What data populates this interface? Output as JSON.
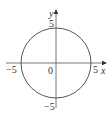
{
  "diagram": {
    "type": "circle-on-axes",
    "equation": "x^2 + y^2 = 25",
    "center": [
      0,
      0
    ],
    "radius": 5,
    "x_axis_label": "x",
    "y_axis_label": "y",
    "origin_label": "0",
    "x_ticks": {
      "neg": "−5",
      "pos": "5"
    },
    "y_ticks": {
      "pos": "5",
      "neg": "−5"
    },
    "colors": {
      "stroke": "#555555",
      "text": "#333333"
    }
  }
}
